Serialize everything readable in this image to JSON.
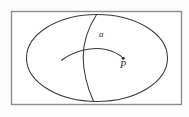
{
  "figure": {
    "canvas": {
      "width": 189,
      "height": 117,
      "background": "#fdfdfd"
    },
    "frame": {
      "name": "outer-rectangle",
      "x": 11.5,
      "y": 11.5,
      "width": 170,
      "height": 93,
      "stroke": "#8d8d8d",
      "fill": "#ffffff"
    },
    "region": {
      "name": "ellipse",
      "cx": 97,
      "cy": 58,
      "rx": 70.5,
      "ry": 43.5,
      "stroke": "#3a3a3a"
    },
    "curves": [
      {
        "name": "curve-a",
        "description": "vertical curve bowing left crossing the ellipse top to bottom",
        "path": "M 96.5 14.8 C 88 28 83 44 83.2 58 C 83.4 75 88.5 90 93.5 101.3",
        "stroke": "#3a3a3a"
      },
      {
        "name": "curve-p",
        "description": "horizontal arc rising then descending to point P",
        "path": "M 61.5 60.2 C 75 50.5 92 46.5 106 49.5 C 115 51.5 120 55 123 58",
        "stroke": "#3a3a3a"
      }
    ],
    "point": {
      "name": "point-P",
      "cx": 123.2,
      "cy": 58.2,
      "r": 1.5,
      "fill": "#2b2b2b"
    },
    "labels": {
      "a": "a",
      "p": "P"
    },
    "colors": {
      "ink": "#2b2b2b",
      "curve": "#3a3a3a",
      "frame": "#8d8d8d",
      "paper": "#ffffff"
    }
  }
}
